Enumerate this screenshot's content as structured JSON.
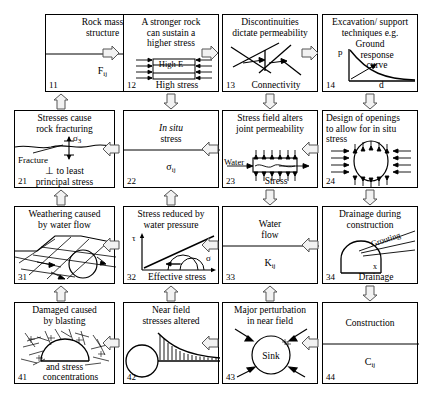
{
  "diagram": {
    "type": "4x4-interaction-matrix",
    "grid": {
      "rows": 4,
      "cols": 4
    },
    "cells": [
      {
        "id": "11",
        "number": "11",
        "title_lines": [
          "Rock mass",
          "structure"
        ],
        "symbol": "F",
        "symbol_sub": "ij",
        "bottom_label": "",
        "graphic": "split-box"
      },
      {
        "id": "12",
        "number": "12",
        "title_lines": [
          "A stronger rock",
          "can sustain a",
          "higher stress"
        ],
        "symbol": "",
        "symbol_sub": "",
        "bottom_label": "High stress",
        "inner_label": "High E",
        "graphic": "layered-block-with-arrows"
      },
      {
        "id": "13",
        "number": "13",
        "title_lines": [
          "Discontinuities",
          "dictate permeability"
        ],
        "symbol": "",
        "symbol_sub": "",
        "bottom_label": "Connectivity",
        "graphic": "fracture-network"
      },
      {
        "id": "14",
        "number": "14",
        "title_lines": [
          "Excavation/ support",
          "techniques e.g.",
          "Ground",
          "response",
          "curve"
        ],
        "symbol": "",
        "symbol_sub": "",
        "bottom_label": "",
        "axis_y": "p",
        "axis_x": "d",
        "graphic": "ground-response-curve"
      },
      {
        "id": "21",
        "number": "21",
        "title_lines": [
          "Stresses cause",
          "rock fracturing"
        ],
        "symbol": "",
        "symbol_sub": "",
        "bottom_label": "",
        "labels": [
          "Fracture",
          "⊥ to least",
          "principal stress"
        ],
        "sigma": "σ",
        "sigma_sub": "3",
        "graphic": "fracture-wave"
      },
      {
        "id": "22",
        "number": "22",
        "title_lines": [
          "In situ",
          "stress"
        ],
        "title_italic_first": true,
        "symbol": "σ",
        "symbol_sub": "ij",
        "bottom_label": "",
        "graphic": "split-box"
      },
      {
        "id": "23",
        "number": "23",
        "title_lines": [
          "Stress field alters",
          "joint permeability"
        ],
        "symbol": "",
        "symbol_sub": "",
        "bottom_label": "Stress",
        "labels": [
          "Water"
        ],
        "graphic": "joint-permeability"
      },
      {
        "id": "24",
        "number": "24",
        "title_lines": [
          "Design of openings",
          "to allow for in situ",
          "stress"
        ],
        "symbol": "",
        "symbol_sub": "",
        "bottom_label": "",
        "graphic": "opening-ellipse"
      },
      {
        "id": "31",
        "number": "31",
        "title_lines": [
          "Weathering caused",
          "by water flow"
        ],
        "symbol": "",
        "symbol_sub": "",
        "bottom_label": "",
        "graphic": "weathering-joints"
      },
      {
        "id": "32",
        "number": "32",
        "title_lines": [
          "Stress reduced by",
          "water pressure"
        ],
        "symbol": "",
        "symbol_sub": "",
        "bottom_label": "Effective stress",
        "axis_y": "τ",
        "axis_x": "σ",
        "graphic": "mohr-circles"
      },
      {
        "id": "33",
        "number": "33",
        "title_lines": [
          "Water",
          "flow"
        ],
        "symbol": "K",
        "symbol_sub": "ij",
        "bottom_label": "",
        "graphic": "split-box"
      },
      {
        "id": "34",
        "number": "34",
        "title_lines": [
          "Drainage during",
          "construction"
        ],
        "symbol": "",
        "symbol_sub": "",
        "bottom_label": "Drainage",
        "labels": [
          "Grouting"
        ],
        "graphic": "tunnel-drainage"
      },
      {
        "id": "41",
        "number": "41",
        "title_lines": [
          "Damaged caused",
          "by blasting"
        ],
        "symbol": "",
        "symbol_sub": "",
        "bottom_label": "and stress",
        "bottom_label2": "concentrations",
        "graphic": "blast-damage"
      },
      {
        "id": "42",
        "number": "42",
        "title_lines": [
          "Near field",
          "stresses altered"
        ],
        "symbol": "",
        "symbol_sub": "",
        "bottom_label": "",
        "graphic": "near-field-stress"
      },
      {
        "id": "43",
        "number": "43",
        "title_lines": [
          "Major perturbation",
          "in near field"
        ],
        "symbol": "",
        "symbol_sub": "",
        "bottom_label": "",
        "labels": [
          "Sink"
        ],
        "graphic": "sink-circle"
      },
      {
        "id": "44",
        "number": "44",
        "title_lines": [
          "Construction"
        ],
        "symbol": "C",
        "symbol_sub": "ij",
        "bottom_label": "",
        "graphic": "split-box"
      }
    ],
    "arrows": {
      "horizontal": [
        {
          "row": 1,
          "gap": 1,
          "direction": "right"
        },
        {
          "row": 1,
          "gap": 2,
          "direction": "right"
        },
        {
          "row": 1,
          "gap": 3,
          "direction": "right"
        },
        {
          "row": 2,
          "gap": 1,
          "direction": "left"
        },
        {
          "row": 2,
          "gap": 2,
          "direction": "left"
        },
        {
          "row": 2,
          "gap": 3,
          "direction": "left"
        },
        {
          "row": 3,
          "gap": 1,
          "direction": "left"
        },
        {
          "row": 3,
          "gap": 2,
          "direction": "left"
        },
        {
          "row": 3,
          "gap": 3,
          "direction": "left"
        },
        {
          "row": 4,
          "gap": 1,
          "direction": "left"
        },
        {
          "row": 4,
          "gap": 2,
          "direction": "left"
        },
        {
          "row": 4,
          "gap": 3,
          "direction": "left"
        }
      ],
      "vertical": [
        {
          "col": 1,
          "gap": 1,
          "direction": "up"
        },
        {
          "col": 2,
          "gap": 1,
          "direction": "down"
        },
        {
          "col": 3,
          "gap": 1,
          "direction": "down"
        },
        {
          "col": 4,
          "gap": 1,
          "direction": "down"
        },
        {
          "col": 1,
          "gap": 2,
          "direction": "up"
        },
        {
          "col": 2,
          "gap": 2,
          "direction": "up"
        },
        {
          "col": 3,
          "gap": 2,
          "direction": "down"
        },
        {
          "col": 4,
          "gap": 2,
          "direction": "down"
        },
        {
          "col": 1,
          "gap": 3,
          "direction": "up"
        },
        {
          "col": 2,
          "gap": 3,
          "direction": "up"
        },
        {
          "col": 3,
          "gap": 3,
          "direction": "up"
        },
        {
          "col": 4,
          "gap": 3,
          "direction": "down"
        }
      ]
    },
    "colors": {
      "line": "#000000",
      "background": "#ffffff",
      "arrow_fill": "#f2f2f2"
    }
  }
}
